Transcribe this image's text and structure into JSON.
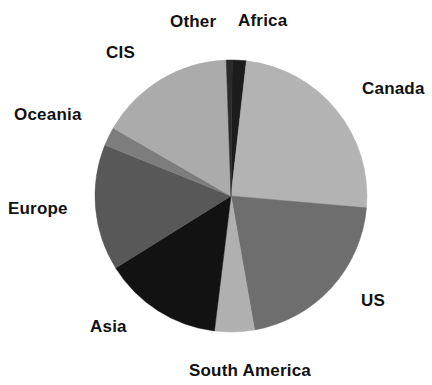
{
  "chart_data": {
    "type": "pie",
    "title": "",
    "subtitle": "",
    "xlabel": "",
    "ylabel": "",
    "legend_position": "around-slices",
    "grid": false,
    "label_placement": "outside",
    "categories": [
      "Africa",
      "Canada",
      "US",
      "South America",
      "Asia",
      "Europe",
      "Oceania",
      "CIS",
      "Other"
    ],
    "values": [
      1.7,
      24.7,
      20.8,
      4.7,
      14.2,
      15.0,
      2.2,
      16.1,
      0.6
    ],
    "units": "percent",
    "start_angle_deg": -90,
    "direction": "clockwise",
    "slices": [
      {
        "label": "Africa",
        "value": 1.7,
        "start_deg": 0.5,
        "end_deg": 6.5,
        "color": "#1c1c1c"
      },
      {
        "label": "Canada",
        "value": 24.7,
        "start_deg": 6.5,
        "end_deg": 95.0,
        "color": "#b3b3b3"
      },
      {
        "label": "US",
        "value": 20.8,
        "start_deg": 95.0,
        "end_deg": 170.0,
        "color": "#6e6e6e"
      },
      {
        "label": "South America",
        "value": 4.7,
        "start_deg": 170.0,
        "end_deg": 187.0,
        "color": "#b0b0b0"
      },
      {
        "label": "Asia",
        "value": 14.2,
        "start_deg": 187.0,
        "end_deg": 238.0,
        "color": "#121212"
      },
      {
        "label": "Europe",
        "value": 15.0,
        "start_deg": 238.0,
        "end_deg": 292.0,
        "color": "#585858"
      },
      {
        "label": "Oceania",
        "value": 2.2,
        "start_deg": 292.0,
        "end_deg": 300.0,
        "color": "#7d7d7d"
      },
      {
        "label": "CIS",
        "value": 16.1,
        "start_deg": 300.0,
        "end_deg": 358.0,
        "color": "#ababab"
      },
      {
        "label": "Other",
        "value": 0.6,
        "start_deg": 358.0,
        "end_deg": 360.5,
        "color": "#2a2a2a"
      }
    ]
  },
  "labels": {
    "other": "Other",
    "africa": "Africa",
    "cis": "CIS",
    "canada": "Canada",
    "oceania": "Oceania",
    "europe": "Europe",
    "us": "US",
    "asia": "Asia",
    "south_america": "South America"
  },
  "colors": {
    "background": "#ffffff",
    "text": "#111111",
    "light_gray": "#b3b3b3",
    "mid_gray": "#7d7d7d",
    "dark_gray": "#585858",
    "near_black": "#121212"
  },
  "geometry": {
    "center_x": 231,
    "center_y": 196,
    "radius": 136
  }
}
